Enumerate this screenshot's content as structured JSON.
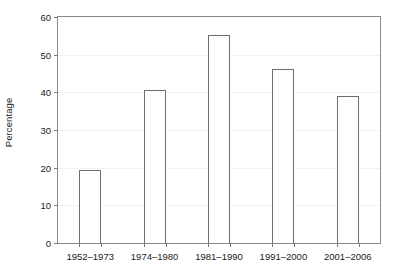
{
  "chart_data": {
    "type": "bar",
    "title": "",
    "xlabel": "",
    "ylabel": "Percentage",
    "categories": [
      "1952–1973",
      "1974–1980",
      "1981–1990",
      "1991–2000",
      "2001–2006"
    ],
    "values": [
      19.5,
      40.5,
      55.2,
      46.2,
      39.0
    ],
    "ylim": [
      0,
      60
    ],
    "yticks": [
      0,
      10,
      20,
      30,
      40,
      50,
      60
    ],
    "ytick_labels": [
      "0",
      "10",
      "20",
      "30",
      "40",
      "50",
      "60"
    ],
    "grid": true,
    "grid_axis": "y",
    "legend": false,
    "bar_fill": "#ffffff",
    "bar_edge": "#6e6e6e",
    "frame_color": "#8a8a8a",
    "grid_color": "#f0f0f0",
    "text_color": "#1a1a1a"
  }
}
